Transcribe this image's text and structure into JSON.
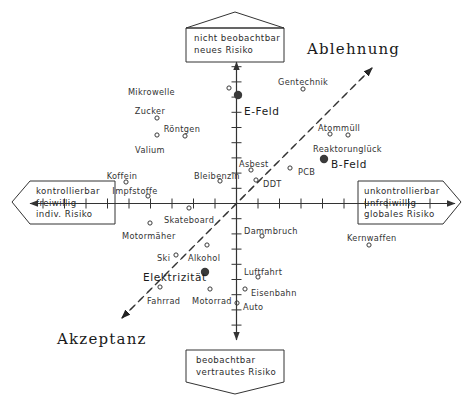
{
  "chart_data": {
    "type": "scatter",
    "title": "",
    "xlabel": "kontrollierbar / freiwillig / indiv. Risiko  ↔  unkontrollierbar / unfreiwillig / globales Risiko",
    "ylabel": "beobachtbar / vertrautes Risiko  ↔  nicht beobachtbar / neues Risiko",
    "xlim": [
      -10,
      10
    ],
    "ylim": [
      -10,
      10
    ],
    "grid": false,
    "legend": "none",
    "axis_ticks_x": 19,
    "axis_ticks_y": 19,
    "quadrant_axes": {
      "top_box": [
        "nicht beobachtbar",
        "neues Risiko"
      ],
      "bottom_box": [
        "beobachtbar",
        "vertrautes Risiko"
      ],
      "left_box": [
        "kontrollierbar",
        "freiwillig",
        "indiv. Risiko"
      ],
      "right_box": [
        "unkontrollierbar",
        "unfreiwillig",
        "globales Risiko"
      ]
    },
    "diagonal": {
      "upper_label": "Ablehnung",
      "lower_label": "Akzeptanz",
      "style": "dashed double-headed arrow"
    },
    "points": [
      {
        "label": "Mikrowelle",
        "x": 175,
        "y": 88,
        "mx": 229,
        "my": 88,
        "marker": "open",
        "align": "right"
      },
      {
        "label": "Zucker",
        "x": 150,
        "y": 107,
        "mx": 157,
        "my": 118,
        "marker": "open",
        "align": "center"
      },
      {
        "label": "Röntgen",
        "x": 182,
        "y": 125,
        "mx": 185,
        "my": 136,
        "marker": "open",
        "align": "center"
      },
      {
        "label": "Valium",
        "x": 150,
        "y": 146,
        "mx": 157,
        "my": 135,
        "marker": "open",
        "align": "center"
      },
      {
        "label": "Koffein",
        "x": 122,
        "y": 172,
        "mx": 126,
        "my": 182,
        "marker": "open",
        "align": "center"
      },
      {
        "label": "Impfstoffe",
        "x": 135,
        "y": 187,
        "mx": 148,
        "my": 196,
        "marker": "open",
        "align": "center"
      },
      {
        "label": "Bleibenzin",
        "x": 194,
        "y": 172,
        "mx": 220,
        "my": 181,
        "marker": "open",
        "align": "left"
      },
      {
        "label": "Asbest",
        "x": 239,
        "y": 160,
        "mx": 251,
        "my": 170,
        "marker": "open",
        "align": "left"
      },
      {
        "label": "PCB",
        "x": 298,
        "y": 168,
        "mx": 290,
        "my": 168,
        "marker": "open",
        "align": "left"
      },
      {
        "label": "DDT",
        "x": 263,
        "y": 180,
        "mx": 256,
        "my": 180,
        "marker": "open",
        "align": "left"
      },
      {
        "label": "Gentechnik",
        "x": 278,
        "y": 78,
        "mx": 303,
        "my": 89,
        "marker": "open",
        "align": "left"
      },
      {
        "label": "Atommüll",
        "x": 318,
        "y": 124,
        "mx": 330,
        "my": 134,
        "marker": "open",
        "align": "left"
      },
      {
        "label": "Reaktorunglück",
        "x": 313,
        "y": 145,
        "mx": 348,
        "my": 135,
        "marker": "open",
        "align": "left"
      },
      {
        "label": "Skateboard",
        "x": 164,
        "y": 216,
        "mx": 189,
        "my": 208,
        "marker": "open",
        "align": "left"
      },
      {
        "label": "Motormäher",
        "x": 122,
        "y": 232,
        "mx": 150,
        "my": 223,
        "marker": "open",
        "align": "left"
      },
      {
        "label": "Ski",
        "x": 157,
        "y": 254,
        "mx": 176,
        "my": 255,
        "marker": "open",
        "align": "left"
      },
      {
        "label": "Alkohol",
        "x": 188,
        "y": 254,
        "mx": 207,
        "my": 245,
        "marker": "open",
        "align": "left"
      },
      {
        "label": "Fahrrad",
        "x": 147,
        "y": 297,
        "mx": 160,
        "my": 287,
        "marker": "open",
        "align": "left"
      },
      {
        "label": "Motorrad",
        "x": 192,
        "y": 297,
        "mx": 210,
        "my": 289,
        "marker": "open",
        "align": "left"
      },
      {
        "label": "Dammbruch",
        "x": 244,
        "y": 227,
        "mx": 262,
        "my": 236,
        "marker": "open",
        "align": "left"
      },
      {
        "label": "Luftfahrt",
        "x": 244,
        "y": 268,
        "mx": 258,
        "my": 277,
        "marker": "open",
        "align": "left"
      },
      {
        "label": "Eisenbahn",
        "x": 251,
        "y": 289,
        "mx": 245,
        "my": 289,
        "marker": "open",
        "align": "left"
      },
      {
        "label": "Auto",
        "x": 243,
        "y": 303,
        "mx": 237,
        "my": 303,
        "marker": "open",
        "align": "left"
      },
      {
        "label": "Kernwaffen",
        "x": 347,
        "y": 234,
        "mx": 369,
        "my": 245,
        "marker": "open",
        "align": "left"
      },
      {
        "label": "E-Feld",
        "x": 244,
        "y": 106,
        "mx": 238,
        "my": 95,
        "marker": "filled",
        "align": "left"
      },
      {
        "label": "B-Feld",
        "x": 331,
        "y": 159,
        "mx": 324,
        "my": 159,
        "marker": "filled",
        "align": "left"
      },
      {
        "label": "Elektrizität",
        "x": 143,
        "y": 272,
        "mx": 205,
        "my": 272,
        "marker": "filled",
        "align": "left"
      }
    ]
  },
  "boxes": {
    "top": {
      "line1": "nicht beobachtbar",
      "line2": "neues Risiko"
    },
    "bottom": {
      "line1": "beobachtbar",
      "line2": "vertrautes Risiko"
    },
    "left": {
      "line1": "kontrollierbar",
      "line2": "freiwillig",
      "line3": "indiv. Risiko"
    },
    "right": {
      "line1": "unkontrollierbar",
      "line2": "unfreiwillig",
      "line3": "globales Risiko"
    }
  },
  "diagonal_labels": {
    "top_right": "Ablehnung",
    "bottom_left": "Akzeptanz"
  },
  "colors": {
    "background": "#ffffff",
    "ink": "#2b2b2b",
    "axis": "#333333",
    "marker": "#3a3a3a"
  }
}
